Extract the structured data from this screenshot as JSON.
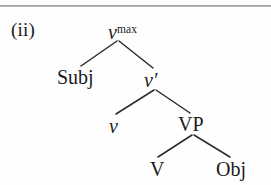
{
  "figure": {
    "label": "(ii)",
    "type": "syntax-tree"
  },
  "rule": {
    "visible": true,
    "color": "#8e8e94"
  },
  "tree": {
    "nodes": [
      {
        "id": "vmax",
        "base": "v",
        "superscript": "max",
        "style": "italic",
        "role": "root"
      },
      {
        "id": "subj",
        "base": "Subj",
        "superscript": "",
        "style": "roman",
        "role": "specifier"
      },
      {
        "id": "vbar",
        "base": "v′",
        "superscript": "",
        "style": "italic",
        "role": "intermediate"
      },
      {
        "id": "v",
        "base": "v",
        "superscript": "",
        "style": "italic",
        "role": "head"
      },
      {
        "id": "vp",
        "base": "VP",
        "superscript": "",
        "style": "roman",
        "role": "complement"
      },
      {
        "id": "vhead",
        "base": "V",
        "superscript": "",
        "style": "roman",
        "role": "head"
      },
      {
        "id": "obj",
        "base": "Obj",
        "superscript": "",
        "style": "roman",
        "role": "complement"
      }
    ],
    "edges": [
      {
        "from": "vmax",
        "to": "subj"
      },
      {
        "from": "vmax",
        "to": "vbar"
      },
      {
        "from": "vbar",
        "to": "v"
      },
      {
        "from": "vbar",
        "to": "vp"
      },
      {
        "from": "vp",
        "to": "vhead"
      },
      {
        "from": "vp",
        "to": "obj"
      }
    ],
    "line_color": "#2b2b2b"
  }
}
